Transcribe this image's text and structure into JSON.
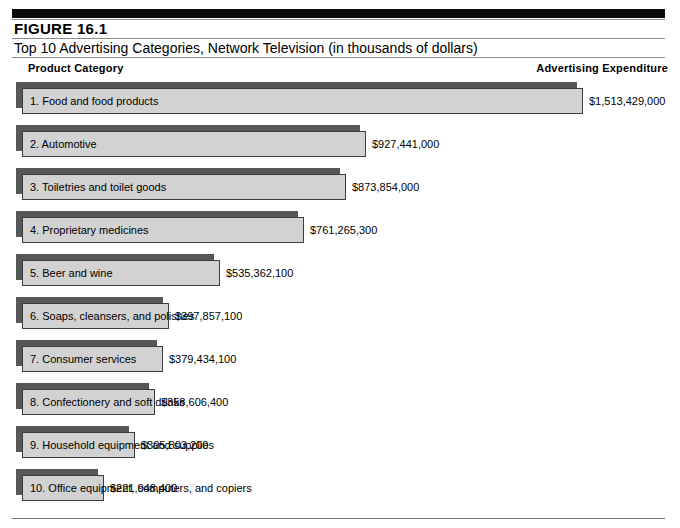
{
  "header": {
    "figure_number": "FIGURE  16.1",
    "title": "Top 10 Advertising Categories, Network Television (in thousands of dollars)",
    "column_left": "Product Category",
    "column_right": "Advertising Expenditure"
  },
  "colors": {
    "bar_face": "#d2d2d2",
    "bar_shadow": "#575757",
    "bar_border": "#3d3d3d",
    "top_rule": "#0b0b0b",
    "rule": "#8c8c8c",
    "text": "#000000"
  },
  "chart_data": {
    "type": "bar",
    "orientation": "horizontal",
    "title": "Top 10 Advertising Categories, Network Television (in thousands of dollars)",
    "figure_number": "FIGURE  16.1",
    "xlabel": "Advertising Expenditure",
    "ylabel": "Product Category",
    "grid": false,
    "legend": "none",
    "xlim": [
      0,
      1513429000
    ],
    "value_prefix": "$",
    "categories": [
      "1. Food and food products",
      "2. Automotive",
      "3. Toiletries and toilet goods",
      "4. Proprietary medicines",
      "5. Beer and wine",
      "6. Soaps, cleansers, and polishes",
      "7. Consumer services",
      "8. Confectionery and soft drinks",
      "9. Household equipment and supplies",
      "10. Office equipment, computers, and copiers"
    ],
    "values": [
      1513429000,
      927441000,
      873854000,
      761265300,
      535362100,
      397857100,
      379434100,
      358606400,
      305803200,
      221948400
    ],
    "value_labels": [
      "$1,513,429,000",
      "$927,441,000",
      "$873,854,000",
      "$761,265,300",
      "$535,362,100",
      "$397,857,100",
      "$379,434,100",
      "$358,606,400",
      "$305,803,200",
      "$221,948,400"
    ]
  }
}
